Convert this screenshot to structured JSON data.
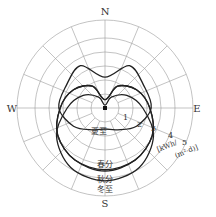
{
  "chart_data": {
    "type": "polar",
    "title": "",
    "directions": {
      "north": "N",
      "south": "S",
      "east": "E",
      "west": "W"
    },
    "radial_ticks": [
      "1",
      "2",
      "3",
      "4",
      "5"
    ],
    "radial_unit": "[kWh/(m²·d)]",
    "rmax": 6,
    "angular_grid_step_deg": 22.5,
    "series": [
      {
        "name": "夏至",
        "label_position": "center-below",
        "note": "two-lobed butterfly shape, extends north and east/west, min toward S",
        "points_deg_value": [
          [
            0,
            2.2
          ],
          [
            30,
            3.5
          ],
          [
            60,
            3.2
          ],
          [
            90,
            3.3
          ],
          [
            120,
            2.6
          ],
          [
            150,
            1.8
          ],
          [
            180,
            1.5
          ],
          [
            210,
            1.8
          ],
          [
            240,
            2.6
          ],
          [
            270,
            3.3
          ],
          [
            300,
            3.2
          ],
          [
            330,
            3.5
          ]
        ]
      },
      {
        "name": "春分",
        "label_position": "south",
        "points_deg_value": [
          [
            0,
            0.6
          ],
          [
            30,
            1.8
          ],
          [
            60,
            2.6
          ],
          [
            90,
            3.2
          ],
          [
            120,
            3.9
          ],
          [
            150,
            4.3
          ],
          [
            180,
            4.4
          ],
          [
            210,
            4.3
          ],
          [
            240,
            3.9
          ],
          [
            270,
            3.2
          ],
          [
            300,
            2.6
          ],
          [
            330,
            1.8
          ]
        ]
      },
      {
        "name": "秋分",
        "label_position": "south",
        "points_deg_value": [
          [
            0,
            0.6
          ],
          [
            30,
            1.8
          ],
          [
            60,
            2.6
          ],
          [
            90,
            3.2
          ],
          [
            120,
            3.9
          ],
          [
            150,
            4.3
          ],
          [
            180,
            4.5
          ],
          [
            210,
            4.3
          ],
          [
            240,
            3.9
          ],
          [
            270,
            3.2
          ],
          [
            300,
            2.6
          ],
          [
            330,
            1.8
          ]
        ]
      },
      {
        "name": "冬至",
        "label_position": "south",
        "points_deg_value": [
          [
            0,
            0.2
          ],
          [
            30,
            0.9
          ],
          [
            60,
            1.8
          ],
          [
            90,
            2.7
          ],
          [
            120,
            4.0
          ],
          [
            150,
            4.9
          ],
          [
            180,
            5.2
          ],
          [
            210,
            4.9
          ],
          [
            240,
            4.0
          ],
          [
            270,
            2.7
          ],
          [
            300,
            1.8
          ],
          [
            330,
            0.9
          ]
        ]
      }
    ]
  },
  "labels": {
    "north": "N",
    "south": "S",
    "east": "E",
    "west": "W",
    "tick1": "1",
    "tick2": "2",
    "tick3": "3",
    "tick4": "4",
    "tick5": "5",
    "unit_line1": "[kWh/",
    "unit_line2": "(m²·d)]",
    "summer": "夏至",
    "spring": "春分",
    "autumn": "秋分",
    "winter": "冬至"
  }
}
